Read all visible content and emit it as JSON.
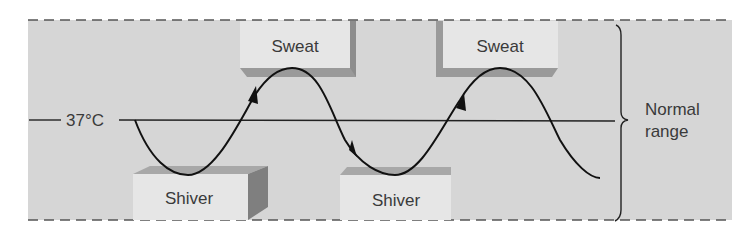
{
  "diagram": {
    "setpoint_label": "37°C",
    "range_label_line1": "Normal",
    "range_label_line2": "range",
    "responses": {
      "sweat": [
        {
          "label": "Sweat",
          "position": "above",
          "index": 1
        },
        {
          "label": "Sweat",
          "position": "above",
          "index": 2
        }
      ],
      "shiver": [
        {
          "label": "Shiver",
          "position": "below",
          "index": 1
        },
        {
          "label": "Shiver",
          "position": "below",
          "index": 2
        }
      ]
    },
    "colors": {
      "panel": "#d6d6d6",
      "box_face": "#e6e6e6",
      "box_shadow": "#9a9a9a",
      "line": "#1a1a1a",
      "text": "#3a3a3a"
    }
  }
}
